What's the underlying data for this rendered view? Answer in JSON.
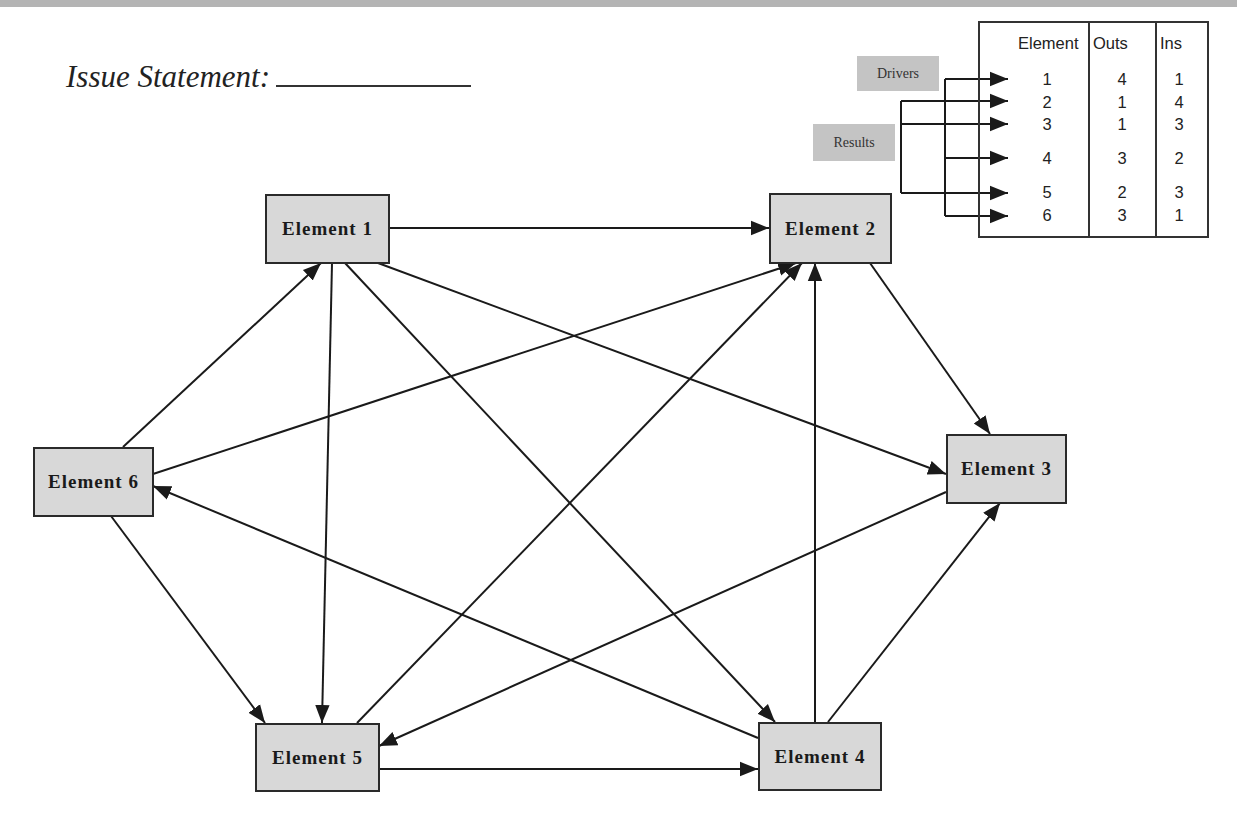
{
  "header": {
    "issue_label": "Issue Statement:"
  },
  "legend": {
    "drivers_label": "Drivers",
    "results_label": "Results"
  },
  "table": {
    "columns": [
      "Element",
      "Outs",
      "Ins"
    ],
    "rows": [
      {
        "element": "1",
        "outs": "4",
        "ins": "1"
      },
      {
        "element": "2",
        "outs": "1",
        "ins": "4"
      },
      {
        "element": "3",
        "outs": "1",
        "ins": "3"
      },
      {
        "element": "4",
        "outs": "3",
        "ins": "2"
      },
      {
        "element": "5",
        "outs": "2",
        "ins": "3"
      },
      {
        "element": "6",
        "outs": "3",
        "ins": "1"
      }
    ],
    "drivers": [
      "1",
      "4",
      "6"
    ],
    "results": [
      "2",
      "3",
      "5"
    ]
  },
  "nodes": [
    {
      "id": "E1",
      "label": "Element 1"
    },
    {
      "id": "E2",
      "label": "Element 2"
    },
    {
      "id": "E3",
      "label": "Element 3"
    },
    {
      "id": "E4",
      "label": "Element 4"
    },
    {
      "id": "E5",
      "label": "Element 5"
    },
    {
      "id": "E6",
      "label": "Element 6"
    }
  ],
  "edges": [
    {
      "from": "E1",
      "to": "E2"
    },
    {
      "from": "E1",
      "to": "E3"
    },
    {
      "from": "E1",
      "to": "E4"
    },
    {
      "from": "E1",
      "to": "E5"
    },
    {
      "from": "E2",
      "to": "E3"
    },
    {
      "from": "E3",
      "to": "E5"
    },
    {
      "from": "E4",
      "to": "E2"
    },
    {
      "from": "E4",
      "to": "E3"
    },
    {
      "from": "E4",
      "to": "E6"
    },
    {
      "from": "E5",
      "to": "E2"
    },
    {
      "from": "E5",
      "to": "E4"
    },
    {
      "from": "E6",
      "to": "E1"
    },
    {
      "from": "E6",
      "to": "E2"
    },
    {
      "from": "E6",
      "to": "E5"
    }
  ],
  "colors": {
    "node_fill": "#d8d8d8",
    "node_border": "#2a2a2a",
    "edge": "#1a1a1a",
    "tag_fill": "#c4c4c4",
    "top_band": "#b4b4b4"
  }
}
